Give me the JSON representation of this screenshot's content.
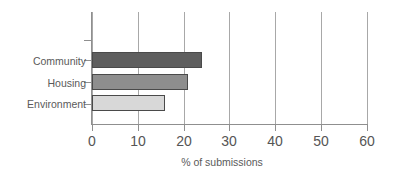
{
  "chart_data": {
    "type": "bar",
    "orientation": "horizontal",
    "title": "",
    "subtitle": "",
    "xlabel": "% of submissions",
    "ylabel": "",
    "categories": [
      "Community",
      "Housing",
      "Environment"
    ],
    "values": [
      24,
      21,
      16
    ],
    "series": [
      {
        "name": "% of submissions",
        "values": [
          24,
          21,
          16
        ]
      }
    ],
    "xlim": [
      0,
      60
    ],
    "xticks": [
      0,
      10,
      20,
      30,
      40,
      50,
      60
    ],
    "xtick_labels": [
      "0",
      "10",
      "20",
      "30",
      "40",
      "50",
      "60"
    ],
    "grid": "vertical",
    "legend": "none",
    "bar_colors": [
      "#5e5e5e",
      "#8e8e8e",
      "#d8d8d8"
    ],
    "bar_edge_color": "#4a4a4a",
    "axis_color": "#8f8f8f",
    "grid_color": "#a8a8a8",
    "text_color": "#555555",
    "background": "#ffffff"
  }
}
